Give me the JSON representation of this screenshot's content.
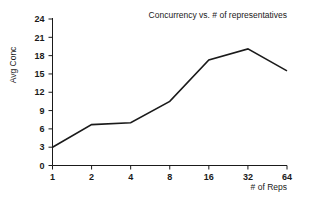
{
  "chart_data": {
    "type": "line",
    "title": "Concurrency vs. # of representatives",
    "xlabel": "# of Reps",
    "ylabel": "Avg Conc",
    "x": [
      1,
      2,
      4,
      8,
      16,
      32,
      64
    ],
    "values": [
      3.0,
      6.7,
      7.0,
      10.5,
      17.3,
      19.1,
      15.5
    ],
    "xtick_labels": [
      "1",
      "2",
      "4",
      "8",
      "16",
      "32",
      "64"
    ],
    "ytick_labels": [
      "0",
      "3",
      "6",
      "9",
      "12",
      "15",
      "18",
      "21",
      "24"
    ],
    "ytick_values": [
      0,
      3,
      6,
      9,
      12,
      15,
      18,
      21,
      24
    ],
    "ylim": [
      0,
      24
    ],
    "xscale": "log2",
    "grid": false,
    "legend": "none",
    "series": [
      {
        "name": "Avg Conc",
        "color": "#1a1a1a",
        "values": [
          3.0,
          6.7,
          7.0,
          10.5,
          17.3,
          19.1,
          15.5
        ]
      }
    ]
  }
}
